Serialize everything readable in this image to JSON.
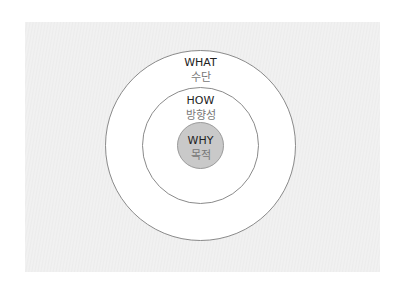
{
  "diagram": {
    "type": "concentric-circles",
    "rings": [
      {
        "id": "outer",
        "label_en": "WHAT",
        "label_ko": "수단",
        "fill": "#ffffff",
        "stroke": "#8a8a8a"
      },
      {
        "id": "middle",
        "label_en": "HOW",
        "label_ko": "방향성",
        "fill": "#ffffff",
        "stroke": "#8a8a8a"
      },
      {
        "id": "inner",
        "label_en": "WHY",
        "label_ko": "목적",
        "fill": "#c9c9c9",
        "stroke": "#9a9a9a"
      }
    ]
  }
}
